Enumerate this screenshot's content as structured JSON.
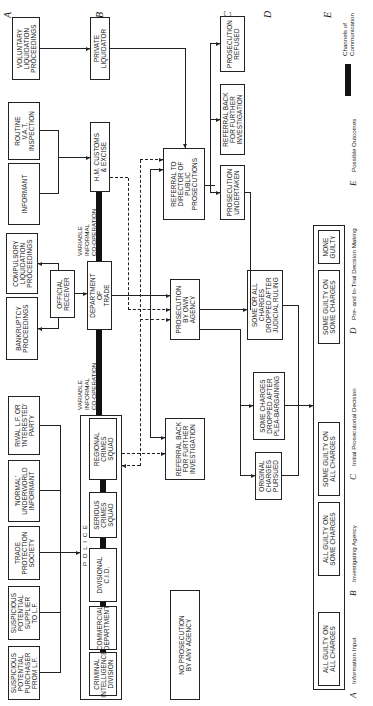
{
  "diagram": {
    "orientation": "rotated-90-counterclockwise",
    "stages": [
      "A",
      "B",
      "C",
      "D",
      "E"
    ],
    "information_inputs": {
      "voluntary_liquidation": "VOLUNTARY\nLIQUIDATION\nPROCEEDINGS",
      "routine_vat": "ROUTINE\nV.A.T.\nINSPECTION",
      "informant": "INFORMANT",
      "compulsory_liquidation": "COMPULSORY\nLIQUIDATION\nPROCEEDINGS",
      "bankruptcy": "BANKRUPTCY\nPROCEEDINGS",
      "rival_lf": "RIVAL L.F. OR\n'INTERESTED'\nPARTY",
      "normal_informant": "'NORMAL'\nUNDERWORLD\nINFORMANT",
      "trade_protection": "TRADE\nPROTECTION\nSOCIETY",
      "suspicious_supplier": "SUSPICIOUS\nPOTENTIAL\nSUPPLIER\nTO L.F.",
      "suspicious_purchaser": "SUSPICIOUS\nPOTENTIAL\nPURCHASER\nFROM L.F."
    },
    "agencies": {
      "private_liquidator": "PRIVATE\nLIQUIDATOR",
      "hm_customs": "H.M. CUSTOMS\n& EXCISE",
      "official_receiver": "OFFICIAL\nRECEIVER",
      "department_of_trade": "DEPARTMENT\nOF\nTRADE",
      "police_label": "P O L I C E",
      "regional_crimes": "REGIONAL\nCRIMES\nSQUAD",
      "serious_crimes": "SERIOUS\nCRIMES\nSQUAD",
      "divisional_cid": "DIVISIONAL\nC.I.D.",
      "commercial_department": "COMMERCIAL\nDEPARTMENT",
      "criminal_intelligence": "CRIMINAL\nINTELLIGENCE\nDIVISION",
      "cooperation_upper": "VARIABLE\nINFORMAL\nCO-OPERATION",
      "cooperation_lower": "VARIABLE\nINFORMAL\nCO-OPERATION"
    },
    "prosecutorial_decisions": {
      "referral_dpp": "REFERRAL TO\nDIRECTOR OF\nPUBLIC\nPROSECUTIONS",
      "prosecution_own_agency": "PROSECUTION\nBY OWN\nAGENCY",
      "referral_back_police": "REFERRAL BACK\nFOR FURTHER\nINVESTIGATION",
      "no_prosecution": "NO PROSECUTION\nBY ANY AGENCY",
      "prosecution_refused": "PROSECUTION\nREFUSED",
      "referral_back_dpp": "REFERRAL BACK\nFOR FURTHER\nINVESTIGATION",
      "prosecution_undertaken": "PROSECUTION\nUNDERTAKEN"
    },
    "trial_decisions": {
      "original_charges": "ORIGINAL\nCHARGES\nPURSUED",
      "plea_bargaining": "SOME CHARGES\nDROPPED AFTER\nPLEA-BARGAINING",
      "judicial_ruling": "SOME OR ALL\nCHARGES\nDROPPED AFTER\nJUDICIAL RULING"
    },
    "outcomes": [
      "ALL GUILTY ON\nALL CHARGES",
      "ALL GUILTY ON\nSOME CHARGES",
      "SOME GUILTY ON\nALL CHARGES",
      "SOME GUILTY ON\nSOME CHARGES",
      "NONE\nGUILTY"
    ],
    "legend": {
      "items": [
        {
          "key": "A",
          "label": "Information Input"
        },
        {
          "key": "B",
          "label": "Investigating Agency"
        },
        {
          "key": "C",
          "label": "Initial Prosecutorial Decision"
        },
        {
          "key": "D",
          "label": "Pre- and In-Trial Decision Making"
        },
        {
          "key": "E",
          "label": "Possible Outcomes"
        }
      ],
      "channels_label": "Channels of\nCommunication"
    }
  }
}
